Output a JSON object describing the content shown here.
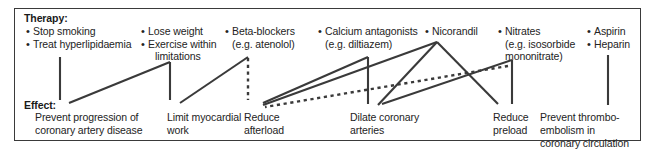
{
  "diagram": {
    "title_therapy": "Therapy:",
    "title_effect": "Effect:",
    "border_color": "#3a3a3a",
    "line_color": "#3a3a3a",
    "background": "#ffffff",
    "therapy_groups": [
      {
        "id": "lifestyle-1",
        "items": [
          "Stop smoking",
          "Treat hyperlipidaemia"
        ],
        "continuations": []
      },
      {
        "id": "lifestyle-2",
        "items": [
          "Lose weight",
          "Exercise within"
        ],
        "continuations": [
          "limitations"
        ]
      },
      {
        "id": "beta-blockers",
        "items": [
          "Beta-blockers"
        ],
        "continuations": [
          "(e.g. atenolol)"
        ]
      },
      {
        "id": "calcium-antagonists",
        "items": [
          "Calcium antagonists"
        ],
        "continuations": [
          "(e.g. diltiazem)"
        ]
      },
      {
        "id": "nicorandil",
        "items": [
          "Nicorandil"
        ],
        "continuations": []
      },
      {
        "id": "nitrates",
        "items": [
          "Nitrates"
        ],
        "continuations": [
          "(e.g. isosorbide",
          "mononitrate)"
        ]
      },
      {
        "id": "antiplatelet",
        "items": [
          "Aspirin",
          "Heparin"
        ],
        "continuations": []
      }
    ],
    "effects": [
      {
        "id": "prevent-progression",
        "lines": [
          "Prevent progression of",
          "coronary artery disease"
        ]
      },
      {
        "id": "limit-myocardial-work",
        "lines": [
          "Limit myocardial",
          "work"
        ]
      },
      {
        "id": "reduce-afterload",
        "lines": [
          "Reduce",
          "afterload"
        ]
      },
      {
        "id": "dilate-coronary-arteries",
        "lines": [
          "Dilate coronary",
          "arteries"
        ]
      },
      {
        "id": "reduce-preload",
        "lines": [
          "Reduce",
          "preload"
        ]
      },
      {
        "id": "prevent-thromboembolism",
        "lines": [
          "Prevent thrombo-",
          "embolism in",
          "coronary circulation"
        ]
      }
    ]
  }
}
